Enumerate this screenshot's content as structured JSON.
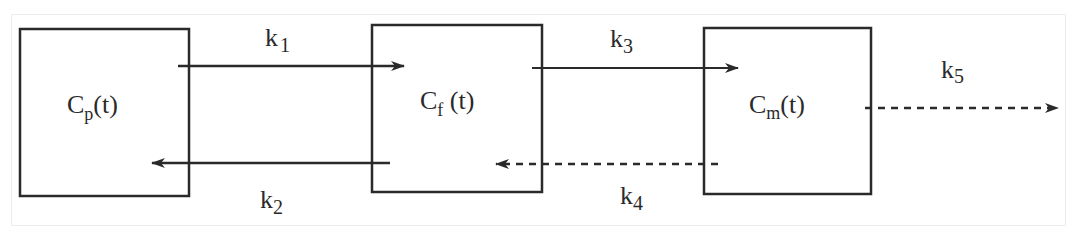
{
  "diagram": {
    "type": "compartment-model",
    "colors": {
      "stroke": "#2a2a2a",
      "frame": "#ececec",
      "background": "#ffffff"
    },
    "compartments": [
      {
        "id": "plasma",
        "main": "C",
        "sub": "p",
        "suffix": "(t)"
      },
      {
        "id": "free",
        "main": "C",
        "sub": "f",
        "suffix": " (t)"
      },
      {
        "id": "metabolite",
        "main": "C",
        "sub": "m",
        "suffix": "(t)"
      }
    ],
    "rates": [
      {
        "id": "k1",
        "main": "k",
        "sub": "1",
        "from": "plasma",
        "to": "free",
        "style": "solid"
      },
      {
        "id": "k2",
        "main": "k",
        "sub": "2",
        "from": "free",
        "to": "plasma",
        "style": "solid"
      },
      {
        "id": "k3",
        "main": "k",
        "sub": "3",
        "from": "free",
        "to": "metabolite",
        "style": "solid"
      },
      {
        "id": "k4",
        "main": "k",
        "sub": "4",
        "from": "metabolite",
        "to": "free",
        "style": "dashed"
      },
      {
        "id": "k5",
        "main": "k",
        "sub": "5",
        "from": "metabolite",
        "to": "out",
        "style": "dashed"
      }
    ]
  }
}
